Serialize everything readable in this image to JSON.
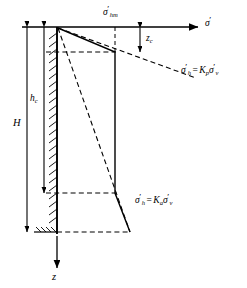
{
  "figure": {
    "name": "earth-pressure-distribution-diagram",
    "type": "engineering-diagram",
    "background_color": "#ffffff",
    "line_color": "#000000"
  },
  "axes": {
    "horizontal_axis_label": "σ′",
    "horizontal_axis_label_parts": {
      "symbol": "σ",
      "prime": "′"
    },
    "vertical_axis_label": "z",
    "vertical_axis_direction": "downward"
  },
  "labels": {
    "sigma_hm": {
      "symbol": "σ",
      "prime": "′",
      "subscript": "hm"
    },
    "zc": {
      "symbol": "z",
      "subscript": "c"
    },
    "H": "H",
    "hc": {
      "symbol": "h",
      "subscript": "c"
    },
    "passive_equation": {
      "sigma": "σ",
      "prime1": "′",
      "sub1": "h",
      "equals": "=",
      "K": "K",
      "sub_K": "p",
      "sigma2": "σ",
      "prime2": "′",
      "sub2": "v"
    },
    "active_equation": {
      "sigma": "σ",
      "prime1": "′",
      "sub1": "h",
      "equals": "=",
      "K": "K",
      "sub_K": "a",
      "sigma2": "σ",
      "prime2": "′",
      "sub2": "v"
    }
  },
  "geometry": {
    "ground_surface_y": 27,
    "wall_x": 57,
    "wall_base_y": 232,
    "tension_crack_depth_y": 52,
    "hc_depth_y": 193,
    "polygon_top_vertex_x": 115,
    "polygon_base_x": 130,
    "axis_arrow_end_x": 202,
    "z_arrow_end_y": 272
  }
}
